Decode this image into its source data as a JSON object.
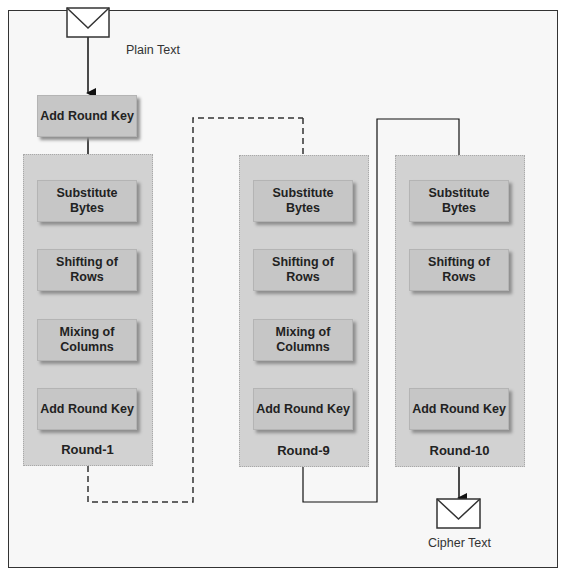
{
  "input": {
    "label": "Plain Text",
    "icon": "envelope-icon"
  },
  "output": {
    "label": "Cipher Text",
    "icon": "envelope-icon"
  },
  "initial_step": {
    "label": "Add Round Key"
  },
  "rounds": [
    {
      "label": "Round-1",
      "steps": [
        "Substitute Bytes",
        "Shifting of Rows",
        "Mixing of Columns",
        "Add Round Key"
      ]
    },
    {
      "label": "Round-9",
      "steps": [
        "Substitute Bytes",
        "Shifting of Rows",
        "Mixing of Columns",
        "Add Round Key"
      ]
    },
    {
      "label": "Round-10",
      "steps": [
        "Substitute Bytes",
        "Shifting of Rows",
        "Add Round Key"
      ]
    }
  ],
  "connectors": {
    "round1_to_round9": "dashed",
    "round9_to_round10": "solid"
  }
}
